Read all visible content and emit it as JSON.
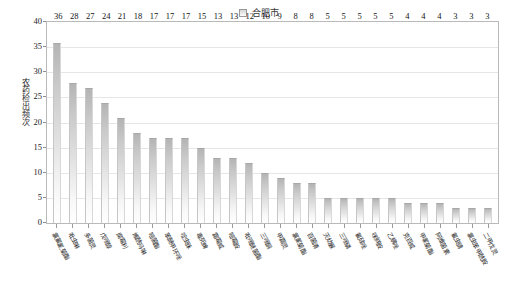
{
  "chart_data": {
    "type": "bar",
    "title": "",
    "subtitle": "",
    "xlabel": "",
    "ylabel": "农药检出频次",
    "ylim": [
      0,
      40
    ],
    "ytick_step": 5,
    "yticks": [
      0,
      5,
      10,
      15,
      20,
      25,
      30,
      35,
      40
    ],
    "grid": true,
    "grid_axis": "y",
    "legend": {
      "position": "top-center",
      "entries": [
        {
          "name": "合肥市",
          "marker": "square",
          "color": "#d4d4d4"
        }
      ]
    },
    "series": [
      {
        "name": "合肥市",
        "values": [
          36,
          28,
          27,
          24,
          21,
          18,
          17,
          17,
          17,
          15,
          13,
          13,
          12,
          10,
          9,
          8,
          8,
          5,
          5,
          5,
          5,
          5,
          4,
          4,
          4,
          3,
          3,
          3
        ]
      }
    ],
    "categories": [
      "氯氟氰菊酯",
      "吡虫啉",
      "多菌灵",
      "戊唑醇",
      "腐霉利",
      "烯酰吗啉",
      "嘧菌酯",
      "苯醚甲环唑",
      "啶虫脒",
      "毒死蜱",
      "霜霉威",
      "嘧霉胺",
      "吡唑醚菌酯",
      "三唑酮",
      "甲霜灵",
      "氯氰菊酯",
      "百菌清",
      "灭幼脲",
      "三唑磷",
      "氟硅唑",
      "咪鲜胺",
      "乙螨唑",
      "克百威",
      "甲氰菊酯",
      "阿维菌素",
      "氟虫腈",
      "氯虫苯甲酰胺",
      "二甲戊灵"
    ],
    "data_labels": [
      "36",
      "28",
      "27",
      "24",
      "21",
      "18",
      "17",
      "17",
      "17",
      "15",
      "13",
      "13",
      "12",
      "10",
      "9",
      "8",
      "8",
      "5",
      "5",
      "5",
      "5",
      "5",
      "4",
      "4",
      "4",
      "3",
      "3",
      "3"
    ],
    "ytick_labels": [
      "0",
      "5",
      "10",
      "15",
      "20",
      "25",
      "30",
      "35",
      "40"
    ],
    "bar_fill": "#d6d6d6",
    "bar_edge": "#a8a8a8"
  }
}
